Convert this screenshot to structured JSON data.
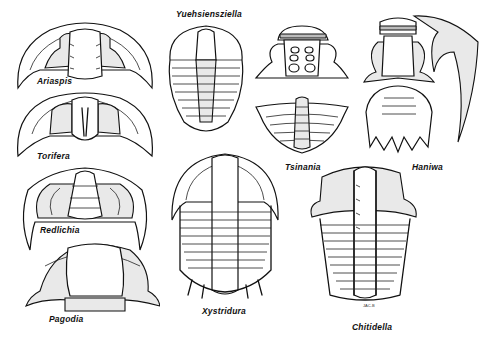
{
  "figure": {
    "specimens": [
      {
        "id": "ariaspis",
        "label": "Ariaspis"
      },
      {
        "id": "torifera",
        "label": "Torifera"
      },
      {
        "id": "redlichia",
        "label": "Redlichia"
      },
      {
        "id": "pagodia",
        "label": "Pagodia"
      },
      {
        "id": "yuehsiensziella",
        "label": "Yuehsiensziella"
      },
      {
        "id": "xystridura",
        "label": "Xystridura"
      },
      {
        "id": "tsinania",
        "label": "Tsinania"
      },
      {
        "id": "haniwa",
        "label": "Haniwa"
      },
      {
        "id": "chitidella",
        "label": "Chitidella"
      }
    ],
    "artist_initials": "JAC-B"
  }
}
